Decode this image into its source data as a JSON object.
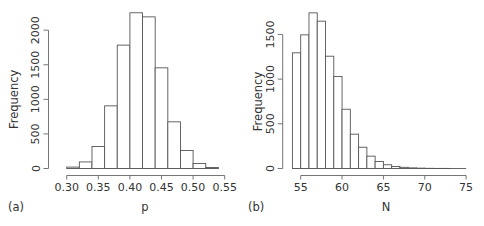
{
  "chart_data": [
    {
      "type": "bar",
      "panel_label": "(a)",
      "title": "",
      "xlabel": "p",
      "ylabel": "Frequency",
      "bin_edges": [
        0.3,
        0.32,
        0.34,
        0.36,
        0.38,
        0.4,
        0.42,
        0.44,
        0.46,
        0.48,
        0.5,
        0.52,
        0.54
      ],
      "categories": [
        "0.30-0.32",
        "0.32-0.34",
        "0.34-0.36",
        "0.36-0.38",
        "0.38-0.40",
        "0.40-0.42",
        "0.42-0.44",
        "0.44-0.46",
        "0.46-0.48",
        "0.48-0.50",
        "0.50-0.52",
        "0.52-0.54"
      ],
      "values": [
        20,
        95,
        318,
        906,
        1784,
        2252,
        2193,
        1456,
        675,
        260,
        72,
        15
      ],
      "xticks": [
        "0.30",
        "0.35",
        "0.40",
        "0.45",
        "0.50",
        "0.55"
      ],
      "xtick_values": [
        0.3,
        0.35,
        0.4,
        0.45,
        0.5,
        0.55
      ],
      "yticks": [
        "0",
        "500",
        "1000",
        "1500",
        "2000"
      ],
      "ytick_values": [
        0,
        500,
        1000,
        1500,
        2000
      ],
      "xlim": [
        0.3,
        0.55
      ],
      "ylim": [
        0,
        2250
      ],
      "grid": false,
      "legend": null
    },
    {
      "type": "bar",
      "panel_label": "(b)",
      "title": "",
      "xlabel": "N",
      "ylabel": "Frequency",
      "bin_edges": [
        54,
        55,
        56,
        57,
        58,
        59,
        60,
        61,
        62,
        63,
        64,
        65,
        66,
        67,
        68,
        69,
        70,
        71,
        72,
        73,
        74,
        75
      ],
      "categories": [
        "54-55",
        "55-56",
        "56-57",
        "57-58",
        "58-59",
        "59-60",
        "60-61",
        "61-62",
        "62-63",
        "63-64",
        "64-65",
        "65-66",
        "66-67",
        "67-68",
        "68-69",
        "69-70",
        "70-71",
        "71-72",
        "72-73",
        "73-74",
        "74-75"
      ],
      "values": [
        1294,
        1495,
        1741,
        1648,
        1256,
        1029,
        663,
        384,
        238,
        138,
        78,
        42,
        22,
        13,
        7,
        4,
        2,
        1,
        1,
        0,
        0
      ],
      "xticks": [
        "55",
        "60",
        "65",
        "70",
        "75"
      ],
      "xtick_values": [
        55,
        60,
        65,
        70,
        75
      ],
      "yticks": [
        "0",
        "500",
        "1000",
        "1500"
      ],
      "ytick_values": [
        0,
        500,
        1000,
        1500
      ],
      "xlim": [
        54,
        75
      ],
      "ylim": [
        0,
        1750
      ],
      "grid": false,
      "legend": null
    }
  ],
  "layout": {
    "panels": [
      {
        "y_axis_x": 48.5,
        "baseline_y": 168.5,
        "x_axis_y": 175.5,
        "px_per_unit_y": 0.06915,
        "x0_val": 0.3,
        "x0_px": 66.7,
        "px_per_unit_x": 632.0,
        "ytick_px_top": 31,
        "ylabel_x": 18,
        "xlabel_x": 145,
        "panel_label_x": 8
      },
      {
        "y_axis_x": 282.7,
        "baseline_y": 168.5,
        "x_axis_y": 175.5,
        "px_per_unit_y": 0.0894,
        "x0_val": 55,
        "x0_px": 300.7,
        "px_per_unit_x": 8.27,
        "ytick_px_top": 34,
        "ylabel_x": 262,
        "xlabel_x": 386,
        "panel_label_x": 248
      }
    ]
  }
}
